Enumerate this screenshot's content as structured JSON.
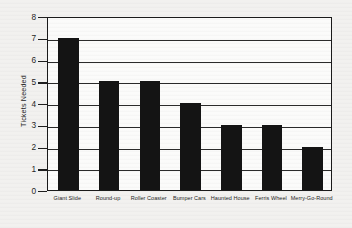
{
  "chart_data": {
    "type": "bar",
    "title": "",
    "xlabel": "",
    "ylabel": "Tickets Needed",
    "categories": [
      "Giant Slide",
      "Round-up",
      "Roller Coaster",
      "Bumper Cars",
      "Haunted House",
      "Ferris Wheel",
      "Merry-Go-Round"
    ],
    "values": [
      7,
      5,
      5,
      4,
      3,
      3,
      2
    ],
    "ylim": [
      0,
      8
    ],
    "ytick_labels": [
      "8",
      "7",
      "6",
      "5",
      "4",
      "3",
      "2",
      "1",
      "0"
    ],
    "ytick_values": [
      8,
      7,
      6,
      5,
      4,
      3,
      2,
      1,
      0
    ],
    "grid": true,
    "legend": "none",
    "bar_color": "#141414",
    "axis_color": "#1a1a1a",
    "background_color": "#f2f1ef"
  }
}
